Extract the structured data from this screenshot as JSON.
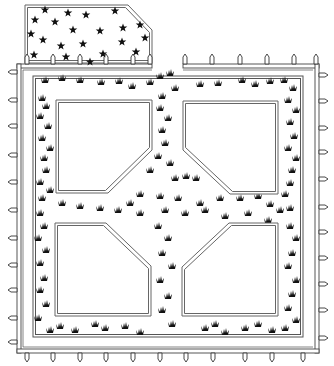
{
  "diagram": {
    "title": "",
    "background": "#ffffff",
    "line_color": "#555555",
    "plant_color": "#111111",
    "flower_bed": {
      "points": [
        [
          25,
          5
        ],
        [
          128,
          5
        ],
        [
          152,
          30
        ],
        [
          152,
          63
        ],
        [
          25,
          63
        ]
      ]
    },
    "fence": {
      "top_left": {
        "x1": 17,
        "x2": 152,
        "y": 64
      },
      "top_right": {
        "x1": 183,
        "x2": 319,
        "y": 64
      },
      "left": {
        "x": 17,
        "y1": 64,
        "y2": 353
      },
      "right": {
        "x": 315,
        "y1": 64,
        "y2": 353
      },
      "bottom": {
        "x1": 17,
        "x2": 319,
        "y": 349
      },
      "posts_top_left": [
        27,
        53,
        80,
        106,
        133,
        150
      ],
      "posts_top_right": [
        185,
        212,
        240,
        267,
        294,
        316
      ],
      "posts_bottom": [
        27,
        53,
        80,
        106,
        133,
        160,
        186,
        213,
        245,
        272,
        303
      ],
      "posts_left": [
        72,
        100,
        126,
        155,
        182,
        210,
        238,
        265,
        290,
        318,
        342
      ],
      "posts_right": [
        75,
        101,
        128,
        152,
        179,
        207,
        232,
        258,
        284,
        310,
        338
      ]
    },
    "inner_boundary": {
      "x": 33,
      "y": 76,
      "w": 270,
      "h": 261
    },
    "plots": [
      {
        "name": "plot-top-left",
        "points": [
          [
            56,
            100
          ],
          [
            152,
            100
          ],
          [
            152,
            150
          ],
          [
            108,
            193
          ],
          [
            56,
            193
          ]
        ]
      },
      {
        "name": "plot-top-right",
        "points": [
          [
            183,
            101
          ],
          [
            278,
            101
          ],
          [
            278,
            194
          ],
          [
            230,
            194
          ],
          [
            183,
            150
          ]
        ]
      },
      {
        "name": "plot-bottom-left",
        "points": [
          [
            55,
            223
          ],
          [
            106,
            223
          ],
          [
            151,
            266
          ],
          [
            151,
            316
          ],
          [
            55,
            316
          ]
        ]
      },
      {
        "name": "plot-bottom-right",
        "points": [
          [
            229,
            223
          ],
          [
            278,
            223
          ],
          [
            278,
            316
          ],
          [
            182,
            316
          ],
          [
            182,
            267
          ]
        ]
      }
    ],
    "flowers": [
      [
        45,
        10
      ],
      [
        68,
        13
      ],
      [
        86,
        15
      ],
      [
        115,
        11
      ],
      [
        35,
        20
      ],
      [
        55,
        22
      ],
      [
        73,
        30
      ],
      [
        100,
        31
      ],
      [
        123,
        28
      ],
      [
        140,
        25
      ],
      [
        31,
        34
      ],
      [
        43,
        40
      ],
      [
        61,
        46
      ],
      [
        83,
        44
      ],
      [
        122,
        42
      ],
      [
        145,
        38
      ],
      [
        34,
        55
      ],
      [
        66,
        57
      ],
      [
        103,
        54
      ],
      [
        136,
        52
      ],
      [
        90,
        62
      ]
    ],
    "plants": [
      [
        45,
        82
      ],
      [
        62,
        80
      ],
      [
        80,
        82
      ],
      [
        101,
        84
      ],
      [
        119,
        83
      ],
      [
        132,
        88
      ],
      [
        150,
        84
      ],
      [
        160,
        78
      ],
      [
        170,
        75
      ],
      [
        175,
        90
      ],
      [
        162,
        98
      ],
      [
        200,
        86
      ],
      [
        218,
        85
      ],
      [
        242,
        82
      ],
      [
        255,
        86
      ],
      [
        270,
        83
      ],
      [
        284,
        82
      ],
      [
        293,
        90
      ],
      [
        42,
        100
      ],
      [
        46,
        108
      ],
      [
        40,
        118
      ],
      [
        48,
        128
      ],
      [
        42,
        140
      ],
      [
        50,
        150
      ],
      [
        44,
        160
      ],
      [
        46,
        172
      ],
      [
        40,
        184
      ],
      [
        50,
        192
      ],
      [
        42,
        200
      ],
      [
        288,
        102
      ],
      [
        296,
        112
      ],
      [
        290,
        124
      ],
      [
        294,
        138
      ],
      [
        288,
        150
      ],
      [
        296,
        160
      ],
      [
        292,
        172
      ],
      [
        290,
        185
      ],
      [
        160,
        110
      ],
      [
        168,
        120
      ],
      [
        162,
        132
      ],
      [
        165,
        145
      ],
      [
        158,
        158
      ],
      [
        170,
        165
      ],
      [
        150,
        172
      ],
      [
        175,
        180
      ],
      [
        186,
        178
      ],
      [
        196,
        180
      ],
      [
        140,
        196
      ],
      [
        130,
        205
      ],
      [
        160,
        198
      ],
      [
        178,
        200
      ],
      [
        200,
        205
      ],
      [
        220,
        200
      ],
      [
        240,
        200
      ],
      [
        258,
        198
      ],
      [
        270,
        206
      ],
      [
        290,
        210
      ],
      [
        285,
        196
      ],
      [
        62,
        205
      ],
      [
        80,
        208
      ],
      [
        100,
        210
      ],
      [
        118,
        212
      ],
      [
        140,
        215
      ],
      [
        165,
        212
      ],
      [
        185,
        215
      ],
      [
        205,
        212
      ],
      [
        225,
        218
      ],
      [
        248,
        215
      ],
      [
        268,
        222
      ],
      [
        280,
        212
      ],
      [
        40,
        215
      ],
      [
        44,
        228
      ],
      [
        38,
        240
      ],
      [
        46,
        252
      ],
      [
        40,
        265
      ],
      [
        44,
        280
      ],
      [
        40,
        292
      ],
      [
        46,
        306
      ],
      [
        38,
        320
      ],
      [
        50,
        332
      ],
      [
        158,
        228
      ],
      [
        168,
        240
      ],
      [
        162,
        255
      ],
      [
        172,
        268
      ],
      [
        160,
        282
      ],
      [
        168,
        298
      ],
      [
        162,
        312
      ],
      [
        172,
        326
      ],
      [
        290,
        228
      ],
      [
        296,
        240
      ],
      [
        292,
        255
      ],
      [
        288,
        268
      ],
      [
        296,
        282
      ],
      [
        292,
        296
      ],
      [
        288,
        310
      ],
      [
        296,
        322
      ],
      [
        60,
        328
      ],
      [
        75,
        332
      ],
      [
        95,
        326
      ],
      [
        105,
        330
      ],
      [
        125,
        328
      ],
      [
        140,
        334
      ],
      [
        205,
        330
      ],
      [
        215,
        326
      ],
      [
        225,
        334
      ],
      [
        245,
        330
      ],
      [
        258,
        326
      ],
      [
        272,
        332
      ],
      [
        285,
        330
      ]
    ]
  }
}
